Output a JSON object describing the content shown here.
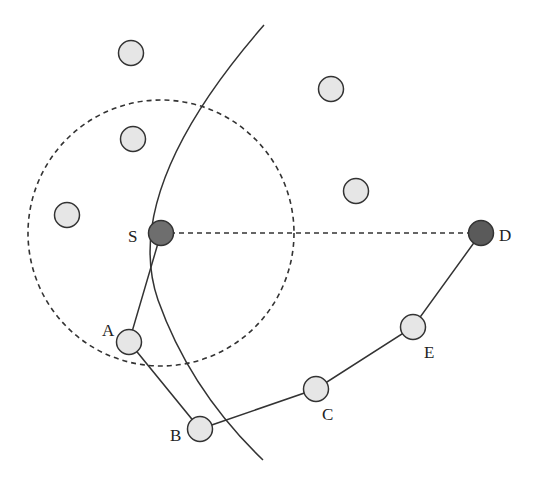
{
  "diagram": {
    "type": "network-routing",
    "colors": {
      "background": "#ffffff",
      "node_fill": "#e6e6e6",
      "endpoint_fill": "#6e6e6e",
      "stroke": "#333333"
    },
    "range_circle": {
      "cx": 161,
      "cy": 233,
      "r": 133,
      "style": "dashed"
    },
    "arc": {
      "style": "solid",
      "path": "M264 25 Q120 190 158 300 Q190 390 263 460"
    },
    "direct_link": {
      "from": "S",
      "to": "D",
      "style": "dashed"
    },
    "nodes": [
      {
        "id": "S",
        "label": "S",
        "x": 161,
        "y": 233,
        "role": "source"
      },
      {
        "id": "D",
        "label": "D",
        "x": 481,
        "y": 233,
        "role": "destination"
      },
      {
        "id": "A",
        "label": "A",
        "x": 129,
        "y": 342,
        "role": "relay"
      },
      {
        "id": "B",
        "label": "B",
        "x": 200,
        "y": 429,
        "role": "relay"
      },
      {
        "id": "C",
        "label": "C",
        "x": 316,
        "y": 389,
        "role": "relay"
      },
      {
        "id": "E",
        "label": "E",
        "x": 413,
        "y": 327,
        "role": "relay"
      },
      {
        "id": "n1",
        "label": "",
        "x": 131,
        "y": 53,
        "role": "neighbor"
      },
      {
        "id": "n2",
        "label": "",
        "x": 133,
        "y": 139,
        "role": "neighbor"
      },
      {
        "id": "n3",
        "label": "",
        "x": 67,
        "y": 215,
        "role": "neighbor"
      },
      {
        "id": "n4",
        "label": "",
        "x": 331,
        "y": 89,
        "role": "neighbor"
      },
      {
        "id": "n5",
        "label": "",
        "x": 356,
        "y": 191,
        "role": "neighbor"
      }
    ],
    "path": [
      "S",
      "A",
      "B",
      "C",
      "E",
      "D"
    ],
    "labels": {
      "S": "S",
      "D": "D",
      "A": "A",
      "B": "B",
      "C": "C",
      "E": "E"
    }
  }
}
